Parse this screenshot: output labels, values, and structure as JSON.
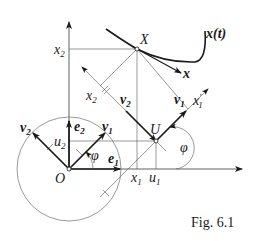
{
  "figure": {
    "caption": "Fig. 6.1"
  },
  "labels": {
    "curve": "x(t)",
    "point_X": "X",
    "tangent": "x",
    "point_U": "U",
    "origin": "O",
    "x2_axis": "x",
    "x2_axis_sub": "2",
    "x2_proj": "x",
    "x2_proj_sub": "2",
    "x1_axis": "x",
    "x1_axis_sub": "1",
    "x1_prime": "x",
    "x1_prime_sub": "1",
    "x1_prime_mark": "′",
    "u1": "u",
    "u1_sub": "1",
    "u2": "u",
    "u2_sub": "2",
    "v1_upper": "v",
    "v1_upper_sub": "1",
    "v2_upper": "v",
    "v2_upper_sub": "2",
    "v1_lower": "v",
    "v1_lower_sub": "1",
    "v2_lower": "v",
    "v2_lower_sub": "2",
    "e1": "e",
    "e1_sub": "1",
    "e2": "e",
    "e2_sub": "2",
    "phi_lower": "φ",
    "phi_upper": "φ"
  },
  "geometry": {
    "origin_O": [
      69,
      169
    ],
    "point_X": [
      137,
      49
    ],
    "point_U": [
      156,
      141
    ],
    "circle_radius": 52,
    "line_color": "#3a3a3a"
  }
}
